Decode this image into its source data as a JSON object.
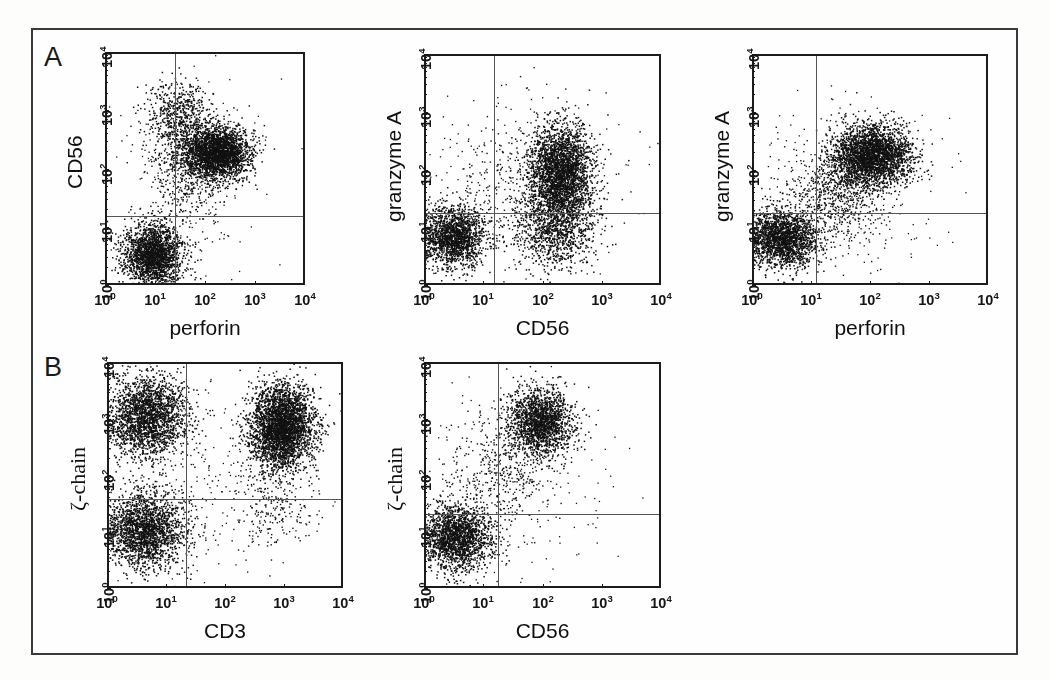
{
  "figure": {
    "background": "#fefefe",
    "frame_color": "#3a3a3a",
    "dot_color": "#111111"
  },
  "panel_letters": [
    {
      "label": "A",
      "x": 44,
      "y": 42
    },
    {
      "label": "B",
      "x": 44,
      "y": 352
    }
  ],
  "axis_ticks": {
    "x": [
      "10⁰",
      "10¹",
      "10²",
      "10³",
      "10⁴"
    ],
    "y": [
      "10⁰",
      "10¹",
      "10²",
      "10³",
      "10⁴"
    ],
    "x_html": [
      "10<sup>0</sup>",
      "10<sup>1</sup>",
      "10<sup>2</sup>",
      "10<sup>3</sup>",
      "10<sup>4</sup>"
    ],
    "y_html": [
      "10<sup>0</sup>",
      "10<sup>1</sup>",
      "10<sup>2</sup>",
      "10<sup>3</sup>",
      "10<sup>4</sup>"
    ]
  },
  "chart_data": {
    "type": "scatter",
    "axis_scale": "log",
    "xlim": [
      1,
      10000
    ],
    "ylim": [
      1,
      10000
    ],
    "grid": false,
    "legend": "none",
    "panels": [
      {
        "id": "A1",
        "row": "A",
        "xlabel": "perforin",
        "ylabel": "CD56",
        "ylabel_font": "sans",
        "left": 105,
        "top": 52,
        "width": 200,
        "height": 233,
        "quadrant_x": 25,
        "quadrant_y": 15,
        "clusters": [
          {
            "name": "CD56-negative perforin-low",
            "cx": 9,
            "cy": 3.4,
            "sx": 0.3,
            "sy": 0.27,
            "n": 2100,
            "size": 1.5
          },
          {
            "name": "CD56-bright perforin-positive",
            "cx": 170,
            "cy": 190,
            "sx": 0.33,
            "sy": 0.23,
            "n": 2600,
            "size": 1.5
          },
          {
            "name": "CD56-bright perforin-low arm",
            "cx": 30,
            "cy": 700,
            "sx": 0.3,
            "sy": 0.33,
            "n": 620,
            "size": 1.5
          },
          {
            "name": "intermediate bridge",
            "cx": 40,
            "cy": 90,
            "sx": 0.38,
            "sy": 0.42,
            "n": 430,
            "size": 1.4
          },
          {
            "name": "scattered background",
            "cx": 60,
            "cy": 60,
            "sx": 0.85,
            "sy": 0.85,
            "n": 200,
            "size": 1.3
          }
        ]
      },
      {
        "id": "A2",
        "row": "A",
        "xlabel": "CD56",
        "ylabel": "granzyme A",
        "ylabel_font": "sans",
        "left": 424,
        "top": 54,
        "width": 237,
        "height": 231,
        "quadrant_x": 15,
        "quadrant_y": 18,
        "clusters": [
          {
            "name": "double-negative",
            "cx": 3.0,
            "cy": 7.0,
            "sx": 0.28,
            "sy": 0.26,
            "n": 1750,
            "size": 1.5
          },
          {
            "name": "CD56+ granzyme A high",
            "cx": 200,
            "cy": 90,
            "sx": 0.26,
            "sy": 0.4,
            "n": 2700,
            "size": 1.5
          },
          {
            "name": "CD56+ granzyme A low tail",
            "cx": 170,
            "cy": 9,
            "sx": 0.32,
            "sy": 0.33,
            "n": 900,
            "size": 1.5
          },
          {
            "name": "sparse mid-range",
            "cx": 60,
            "cy": 40,
            "sx": 0.6,
            "sy": 0.72,
            "n": 430,
            "size": 1.4
          },
          {
            "name": "scattered background",
            "cx": 30,
            "cy": 60,
            "sx": 0.95,
            "sy": 0.85,
            "n": 230,
            "size": 1.3
          }
        ]
      },
      {
        "id": "A3",
        "row": "A",
        "xlabel": "perforin",
        "ylabel": "granzyme A",
        "ylabel_font": "sans",
        "left": 752,
        "top": 54,
        "width": 236,
        "height": 231,
        "quadrant_x": 12,
        "quadrant_y": 18,
        "clusters": [
          {
            "name": "double-negative",
            "cx": 3.2,
            "cy": 6.5,
            "sx": 0.3,
            "sy": 0.25,
            "n": 2000,
            "size": 1.5
          },
          {
            "name": "double-positive",
            "cx": 110,
            "cy": 180,
            "sx": 0.33,
            "sy": 0.26,
            "n": 2700,
            "size": 1.5
          },
          {
            "name": "diagonal bridge",
            "cx": 25,
            "cy": 40,
            "sx": 0.42,
            "sy": 0.44,
            "n": 760,
            "size": 1.4
          },
          {
            "name": "scattered background",
            "cx": 40,
            "cy": 60,
            "sx": 0.85,
            "sy": 0.8,
            "n": 220,
            "size": 1.3
          }
        ]
      },
      {
        "id": "B1",
        "row": "B",
        "xlabel": "CD3",
        "ylabel": "ζ-chain",
        "ylabel_font": "serif",
        "left": 107,
        "top": 362,
        "width": 236,
        "height": 226,
        "quadrant_x": 22,
        "quadrant_y": 38,
        "clusters": [
          {
            "name": "CD3-negative ζ-chain high",
            "cx": 4.5,
            "cy": 1100,
            "sx": 0.34,
            "sy": 0.36,
            "n": 2250,
            "size": 1.5
          },
          {
            "name": "CD3-negative ζ-chain low",
            "cx": 4.2,
            "cy": 11,
            "sx": 0.35,
            "sy": 0.33,
            "n": 2100,
            "size": 1.5
          },
          {
            "name": "CD3-positive ζ-chain high",
            "cx": 900,
            "cy": 700,
            "sx": 0.27,
            "sy": 0.37,
            "n": 3200,
            "size": 1.5
          },
          {
            "name": "CD3-positive sparse low",
            "cx": 600,
            "cy": 25,
            "sx": 0.35,
            "sy": 0.38,
            "n": 200,
            "size": 1.4
          },
          {
            "name": "scattered background",
            "cx": 40,
            "cy": 80,
            "sx": 1.0,
            "sy": 0.9,
            "n": 230,
            "size": 1.3
          }
        ]
      },
      {
        "id": "B2",
        "row": "B",
        "xlabel": "CD56",
        "ylabel": "ζ-chain",
        "ylabel_font": "serif",
        "left": 424,
        "top": 362,
        "width": 237,
        "height": 226,
        "quadrant_x": 18,
        "quadrant_y": 20,
        "clusters": [
          {
            "name": "CD56-negative ζ-chain low",
            "cx": 3.4,
            "cy": 8.0,
            "sx": 0.3,
            "sy": 0.28,
            "n": 1900,
            "size": 1.5
          },
          {
            "name": "CD56-positive ζ-chain high",
            "cx": 90,
            "cy": 900,
            "sx": 0.27,
            "sy": 0.3,
            "n": 1750,
            "size": 1.5
          },
          {
            "name": "diagonal bridge",
            "cx": 20,
            "cy": 120,
            "sx": 0.42,
            "sy": 0.48,
            "n": 430,
            "size": 1.4
          },
          {
            "name": "scattered background",
            "cx": 30,
            "cy": 70,
            "sx": 0.95,
            "sy": 0.95,
            "n": 190,
            "size": 1.3
          }
        ]
      }
    ]
  }
}
